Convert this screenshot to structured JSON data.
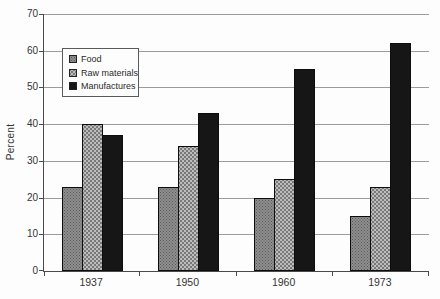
{
  "figure": {
    "background_color": "#fdfdfd",
    "gridline_color": "#9b9b9b",
    "axis_color": "#4a4a4a",
    "text_color": "#333333"
  },
  "chart_data": {
    "type": "bar",
    "title": "",
    "xlabel": "",
    "ylabel": "Percent",
    "categories": [
      "1937",
      "1950",
      "1960",
      "1973"
    ],
    "series": [
      {
        "name": "Food",
        "color": "#8f8f8f",
        "pattern": "fine-dots",
        "values": [
          23,
          23,
          20,
          15
        ]
      },
      {
        "name": "Raw materials",
        "color": "#bcbcbc",
        "pattern": "coarse-dots",
        "values": [
          40,
          34,
          25,
          23
        ]
      },
      {
        "name": "Manufactures",
        "color": "#161616",
        "pattern": "solid",
        "values": [
          37,
          43,
          55,
          62
        ]
      }
    ],
    "ylim": [
      0,
      70
    ],
    "yticks": [
      0,
      10,
      20,
      30,
      40,
      50,
      60,
      70
    ],
    "grid": true,
    "legend_position": "upper-left-inside"
  }
}
